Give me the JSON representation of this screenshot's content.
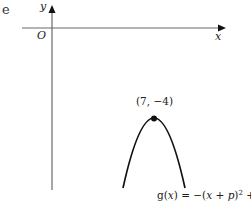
{
  "question_part": "e",
  "axes": {
    "x_label": "x",
    "y_label": "y",
    "origin_label": "O"
  },
  "vertex": {
    "label": "(7, −4)",
    "x": 7,
    "y": -4
  },
  "curve": {
    "name": "g(x)",
    "equation_parts": {
      "lhs": "g(",
      "var": "x",
      "mid": ") = −(",
      "var2": "x",
      "plus": " + ",
      "p": "p",
      "close": ")",
      "exp": "2",
      "tail": " + ",
      "q": "q"
    },
    "shape": "downward parabola"
  },
  "colors": {
    "axis": "#6b6b6b",
    "curve": "#111111",
    "text": "#222222"
  }
}
